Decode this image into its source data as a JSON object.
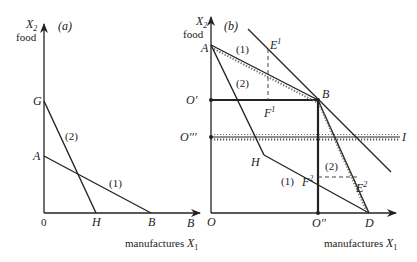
{
  "panel_a": {
    "tag": "(a)",
    "y_axis_label": "X",
    "y_axis_sub": "2",
    "y_axis_word": "food",
    "x_axis_word": "manufactures",
    "x_axis_label": "X",
    "x_axis_sub": "1",
    "origin": "0",
    "points": {
      "G": "G",
      "A": "A",
      "H": "H",
      "B": "B"
    },
    "axis_end_label": "B",
    "lines": {
      "one": "(1)",
      "two": "(2)"
    }
  },
  "panel_b": {
    "tag": "(b)",
    "y_axis_label": "X",
    "y_axis_sub": "2",
    "y_axis_word": "food",
    "x_axis_word": "manufactures",
    "x_axis_label": "X",
    "x_axis_sub": "1",
    "points": {
      "A": "A",
      "B": "B",
      "O": "O",
      "O1": "O′",
      "O3": "O′′′",
      "O2": "O′′",
      "D": "D",
      "H": "H",
      "I": "I",
      "E1": "E",
      "E1_sup": "1",
      "F1": "F",
      "F1_sup": "1",
      "E2": "E",
      "E2_sup": "2",
      "F2": "F",
      "F2_sup": "2"
    },
    "lines": {
      "one_top": "(1)",
      "two_top": "(2)",
      "one_bottom": "(1)",
      "two_bottom": "(2)"
    }
  }
}
